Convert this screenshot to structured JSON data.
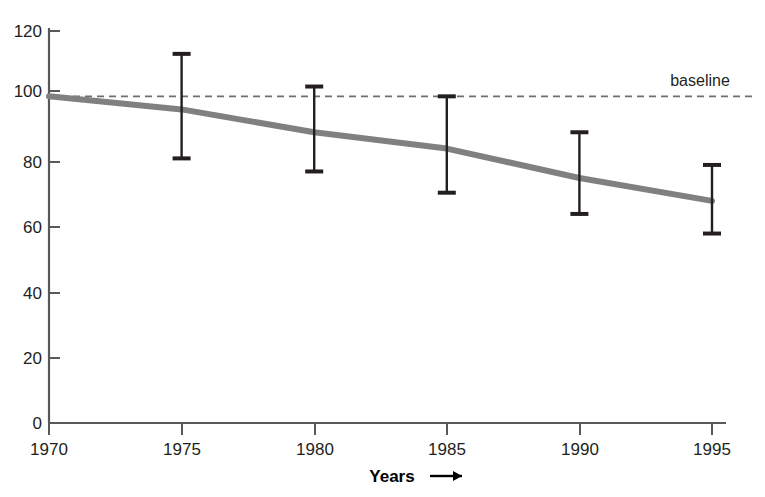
{
  "chart_data": {
    "type": "line",
    "title": "",
    "subtitle": "",
    "xlabel": "Years",
    "xlabel_suffix": "⟶",
    "ylabel": "",
    "x": [
      1970,
      1975,
      1980,
      1985,
      1990,
      1995
    ],
    "xtick_labels": [
      "1970",
      "1975",
      "1980",
      "1985",
      "1990",
      "1995"
    ],
    "ytick_labels": [
      "0",
      "20",
      "40",
      "60",
      "80",
      "100",
      "120"
    ],
    "ytick_values": [
      0,
      20,
      40,
      60,
      80,
      100,
      120
    ],
    "xlim": [
      1970,
      1995
    ],
    "ylim": [
      0,
      120
    ],
    "grid": false,
    "legend": "none",
    "series": [
      {
        "name": "trend",
        "values": [
          100,
          96,
          89,
          84,
          75,
          68
        ],
        "color": "#808080",
        "line_width": 6
      }
    ],
    "error_bars": {
      "color": "#231f20",
      "points": [
        {
          "x": 1975,
          "low": 81,
          "high": 113
        },
        {
          "x": 1980,
          "low": 77,
          "high": 103
        },
        {
          "x": 1985,
          "low": 70.5,
          "high": 100
        },
        {
          "x": 1990,
          "low": 64,
          "high": 89
        },
        {
          "x": 1995,
          "low": 58,
          "high": 79
        }
      ]
    },
    "reference_lines": [
      {
        "name": "baseline",
        "label": "baseline",
        "y": 100,
        "style": "dashed",
        "color": "#6d6e71",
        "label_position": "top-right"
      }
    ],
    "axis_color": "#58595b",
    "background": "#ffffff"
  },
  "annotations": {
    "baseline_label": "baseline"
  }
}
